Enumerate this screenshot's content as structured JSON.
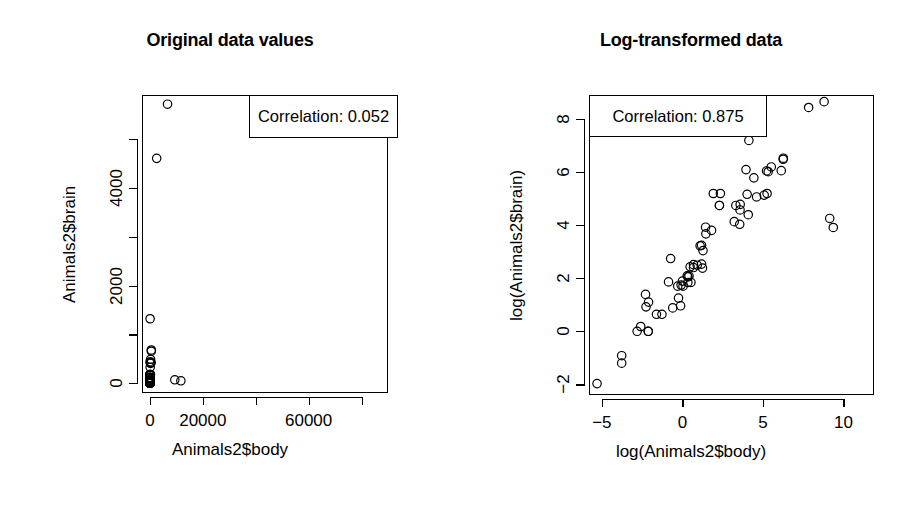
{
  "figure": {
    "background": "#ffffff",
    "foreground": "#000000",
    "width": 921,
    "height": 529
  },
  "panels": [
    {
      "id": "original",
      "title": "Original data values",
      "legend_label": "Correlation: 0.052",
      "x_title": "Animals2$body",
      "y_title": "Animals2$brain",
      "x_ticks": [
        {
          "value": 0,
          "label": "0"
        },
        {
          "value": 20000,
          "label": "20000"
        },
        {
          "value": 40000,
          "label": ""
        },
        {
          "value": 60000,
          "label": "60000"
        },
        {
          "value": 80000,
          "label": ""
        }
      ],
      "y_ticks": [
        {
          "value": 0,
          "label": "0"
        },
        {
          "value": 1000,
          "label": ""
        },
        {
          "value": 2000,
          "label": "2000"
        },
        {
          "value": 3000,
          "label": ""
        },
        {
          "value": 4000,
          "label": "4000"
        },
        {
          "value": 5000,
          "label": ""
        }
      ]
    },
    {
      "id": "log",
      "title": "Log-transformed data",
      "legend_label": "Correlation: 0.875",
      "x_title": "log(Animals2$body)",
      "y_title": "log(Animals2$brain)",
      "x_ticks": [
        {
          "value": -5,
          "label": "-5"
        },
        {
          "value": 0,
          "label": "0"
        },
        {
          "value": 5,
          "label": "5"
        },
        {
          "value": 10,
          "label": "10"
        }
      ],
      "y_ticks": [
        {
          "value": -2,
          "label": "-2"
        },
        {
          "value": 0,
          "label": "0"
        },
        {
          "value": 2,
          "label": "2"
        },
        {
          "value": 4,
          "label": "4"
        },
        {
          "value": 6,
          "label": "6"
        },
        {
          "value": 8,
          "label": "8"
        }
      ]
    }
  ],
  "chart_data": [
    {
      "type": "scatter",
      "title": "Original data values",
      "xlabel": "Animals2$body",
      "ylabel": "Animals2$brain",
      "xlim": [
        -3000,
        90000
      ],
      "ylim": [
        -200,
        5900
      ],
      "xticks": [
        0,
        20000,
        40000,
        60000,
        80000
      ],
      "xticklabels": [
        "0",
        "20000",
        "",
        "60000",
        ""
      ],
      "yticks": [
        0,
        1000,
        2000,
        3000,
        4000,
        5000
      ],
      "yticklabels": [
        "0",
        "",
        "2000",
        "",
        "4000",
        ""
      ],
      "grid": false,
      "marker": "open-circle",
      "annotation": "Correlation: 0.052",
      "legend_position": "top-right",
      "x": [
        1.35,
        465,
        36.33,
        27.66,
        1.04,
        11700,
        2547,
        187.1,
        521,
        10,
        3.3,
        529,
        207,
        62,
        6654,
        9400,
        6.8,
        35,
        0.12,
        0.023,
        2.5,
        55.5,
        100,
        52.16,
        10.55,
        0.55,
        60,
        3.6,
        4.288,
        0.28,
        0.075,
        0.122,
        192,
        3,
        160,
        0.9,
        1.62,
        0.104,
        4.235,
        0.425,
        0.101,
        0.92,
        1,
        0.005,
        0.06,
        3.5,
        2,
        1.4,
        250,
        0.48,
        10,
        1.7,
        6.1,
        0.023,
        0.785,
        25,
        3.3,
        0.2,
        1.41,
        85,
        36,
        0.75,
        2.0,
        0.12,
        1.5
      ],
      "y": [
        8.1,
        423,
        119.5,
        115,
        5.5,
        50,
        4603,
        419,
        655,
        115,
        25.6,
        680,
        406,
        1320,
        5712,
        70,
        179,
        56,
        1,
        0.4,
        12.1,
        175,
        157,
        440,
        179.5,
        2.4,
        81,
        21,
        39.2,
        1.9,
        1.2,
        3,
        180,
        25,
        169,
        2.6,
        11.4,
        2.5,
        50.4,
        6.4,
        4,
        5.7,
        6.6,
        0.14,
        1,
        10.8,
        12.3,
        6.3,
        490,
        15.5,
        115,
        6.3,
        44.5,
        0.3,
        3.5,
        62,
        12.5,
        1.9,
        7.8,
        325,
        97,
        5.5,
        11,
        1.0,
        8.0
      ]
    },
    {
      "type": "scatter",
      "title": "Log-transformed data",
      "xlabel": "log(Animals2$body)",
      "ylabel": "log(Animals2$brain)",
      "xlim": [
        -5.8,
        11.9
      ],
      "ylim": [
        -2.4,
        8.9
      ],
      "xticks": [
        -5,
        0,
        5,
        10
      ],
      "xticklabels": [
        "-5",
        "0",
        "5",
        "10"
      ],
      "yticks": [
        -2,
        0,
        2,
        4,
        6,
        8
      ],
      "yticklabels": [
        "-2",
        "0",
        "2",
        "4",
        "6",
        "8"
      ],
      "grid": false,
      "marker": "open-circle",
      "annotation": "Correlation: 0.875",
      "legend_position": "top-left",
      "x": [
        0.3,
        6.14,
        3.59,
        3.32,
        0.04,
        9.37,
        7.84,
        5.23,
        6.26,
        2.3,
        1.19,
        6.27,
        5.33,
        4.13,
        8.8,
        9.15,
        1.92,
        3.56,
        -2.12,
        -3.77,
        0.92,
        4.02,
        4.61,
        3.95,
        2.36,
        -0.6,
        4.09,
        1.28,
        1.46,
        -1.27,
        -2.59,
        -2.1,
        5.26,
        1.1,
        5.08,
        -0.11,
        0.48,
        -2.26,
        1.44,
        -0.86,
        -2.29,
        -0.08,
        0.0,
        -5.3,
        -2.81,
        1.25,
        0.69,
        0.34,
        5.52,
        -0.73,
        2.3,
        0.53,
        1.81,
        -3.77,
        -0.24,
        3.22,
        1.19,
        -1.61,
        0.34,
        4.44,
        3.58,
        -0.29,
        0.69,
        -2.12,
        0.41
      ],
      "y": [
        2.09,
        6.05,
        4.78,
        4.74,
        1.7,
        3.91,
        8.43,
        6.04,
        6.48,
        4.74,
        3.24,
        6.52,
        6.01,
        7.19,
        8.65,
        4.25,
        5.19,
        4.03,
        0.0,
        -0.92,
        2.49,
        5.16,
        5.06,
        6.09,
        5.19,
        0.88,
        4.39,
        3.04,
        3.67,
        0.64,
        0.18,
        1.1,
        5.19,
        3.22,
        5.13,
        0.96,
        2.43,
        0.92,
        3.92,
        1.86,
        1.39,
        1.74,
        1.89,
        -1.97,
        0.0,
        2.38,
        2.51,
        1.84,
        6.19,
        2.74,
        4.74,
        1.84,
        3.8,
        -1.2,
        1.25,
        4.13,
        2.53,
        0.64,
        2.05,
        5.78,
        4.57,
        1.7,
        2.4,
        0.0,
        2.08
      ]
    }
  ]
}
